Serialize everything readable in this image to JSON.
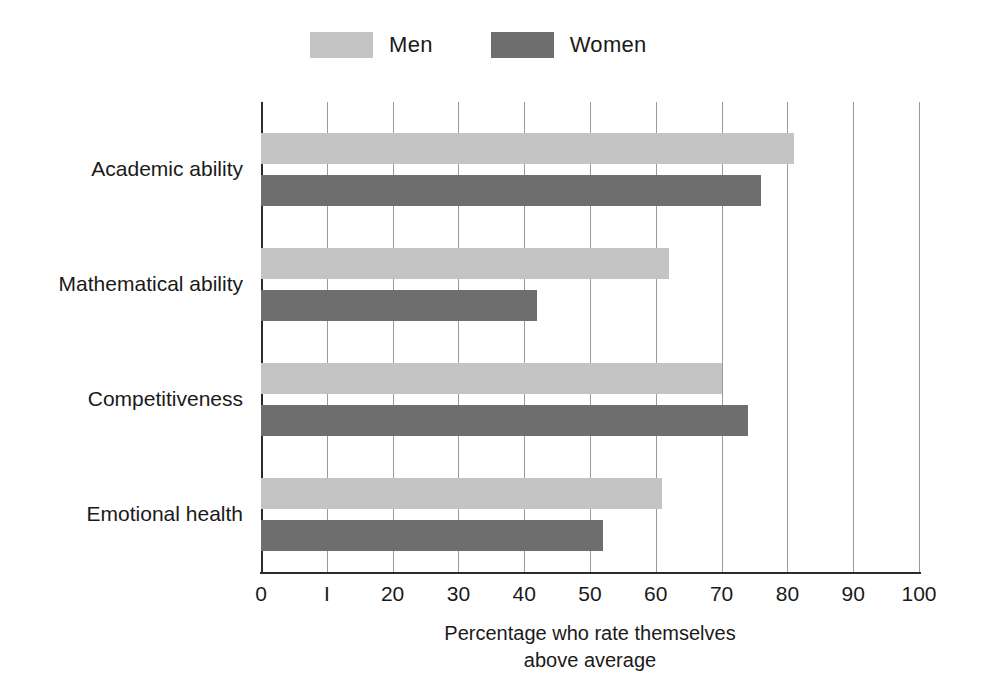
{
  "chart_data": {
    "type": "bar",
    "orientation": "horizontal",
    "title": "",
    "xlabel_lines": [
      "Percentage who rate themselves",
      "above average"
    ],
    "ylabel": "",
    "categories": [
      "Academic ability",
      "Mathematical ability",
      "Competitiveness",
      "Emotional health"
    ],
    "series": [
      {
        "name": "Men",
        "color": "#c4c4c4",
        "values": [
          81,
          62,
          70,
          61
        ]
      },
      {
        "name": "Women",
        "color": "#6e6e6e",
        "values": [
          76,
          42,
          74,
          52
        ]
      }
    ],
    "xlim": [
      0,
      100
    ],
    "xticks": [
      0,
      10,
      20,
      30,
      40,
      50,
      60,
      70,
      80,
      90,
      100
    ],
    "xtick_labels": [
      "0",
      "I",
      "20",
      "30",
      "40",
      "50",
      "60",
      "70",
      "80",
      "90",
      "100"
    ],
    "grid": true,
    "grid_axis": "x",
    "legend_position": "top"
  },
  "legend": {
    "entries": [
      {
        "label": "Men",
        "color": "#c4c4c4",
        "swatch_name": "legend-swatch-men"
      },
      {
        "label": "Women",
        "color": "#6e6e6e",
        "swatch_name": "legend-swatch-women"
      }
    ]
  },
  "colors": {
    "men": "#c4c4c4",
    "women": "#6e6e6e",
    "grid": "#9a9a9a",
    "axis": "#2b2b2b",
    "text": "#1a1a1a",
    "background": "#ffffff"
  }
}
